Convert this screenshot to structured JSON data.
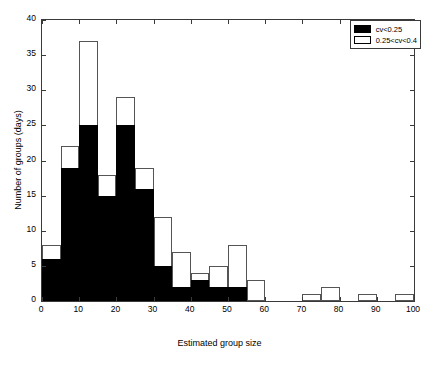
{
  "chart_data": {
    "type": "bar",
    "title": "",
    "subtitle": "",
    "xlabel": "Estimated group size",
    "ylabel": "Number of groups (days)",
    "xlim": [
      0,
      100
    ],
    "ylim": [
      0,
      40
    ],
    "xticks": [
      0,
      10,
      20,
      30,
      40,
      50,
      60,
      70,
      80,
      90,
      100
    ],
    "yticks": [
      0,
      5,
      10,
      15,
      20,
      25,
      30,
      35,
      40
    ],
    "grid": false,
    "bin_width": 5,
    "stacked": true,
    "legend_position": "top-right",
    "legend": [
      {
        "label": "cv<0.25",
        "style": "filled",
        "color": "#000000"
      },
      {
        "label": "0.25<cv<0.4",
        "style": "hollow",
        "color": "#ffffff"
      }
    ],
    "series": [
      {
        "name": "cv<0.25",
        "values": [
          6,
          19,
          25,
          15,
          25,
          16,
          5,
          2,
          3,
          2,
          2,
          0,
          0,
          0,
          0,
          0,
          0,
          0,
          0,
          0
        ]
      },
      {
        "name": "0.25<cv<0.4",
        "values": [
          2,
          3,
          12,
          3,
          4,
          3,
          7,
          5,
          1,
          3,
          6,
          3,
          0,
          0,
          1,
          2,
          0,
          1,
          0,
          1
        ]
      }
    ],
    "totals": [
      8,
      22,
      37,
      18,
      29,
      19,
      12,
      7,
      4,
      5,
      8,
      3,
      0,
      0,
      1,
      2,
      0,
      1,
      0,
      1
    ],
    "bins": [
      {
        "x0": 0,
        "x1": 5,
        "black": 6,
        "total": 8
      },
      {
        "x0": 5,
        "x1": 10,
        "black": 19,
        "total": 22
      },
      {
        "x0": 10,
        "x1": 15,
        "black": 25,
        "total": 37
      },
      {
        "x0": 15,
        "x1": 20,
        "black": 15,
        "total": 18
      },
      {
        "x0": 20,
        "x1": 25,
        "black": 25,
        "total": 29
      },
      {
        "x0": 25,
        "x1": 30,
        "black": 16,
        "total": 19
      },
      {
        "x0": 30,
        "x1": 35,
        "black": 5,
        "total": 12
      },
      {
        "x0": 35,
        "x1": 40,
        "black": 2,
        "total": 7
      },
      {
        "x0": 40,
        "x1": 45,
        "black": 3,
        "total": 4
      },
      {
        "x0": 45,
        "x1": 50,
        "black": 2,
        "total": 5
      },
      {
        "x0": 50,
        "x1": 55,
        "black": 2,
        "total": 8
      },
      {
        "x0": 55,
        "x1": 60,
        "black": 0,
        "total": 3
      },
      {
        "x0": 60,
        "x1": 65,
        "black": 0,
        "total": 0
      },
      {
        "x0": 65,
        "x1": 70,
        "black": 0,
        "total": 0
      },
      {
        "x0": 70,
        "x1": 75,
        "black": 0,
        "total": 1
      },
      {
        "x0": 75,
        "x1": 80,
        "black": 0,
        "total": 2
      },
      {
        "x0": 80,
        "x1": 85,
        "black": 0,
        "total": 0
      },
      {
        "x0": 85,
        "x1": 90,
        "black": 0,
        "total": 1
      },
      {
        "x0": 90,
        "x1": 95,
        "black": 0,
        "total": 0
      },
      {
        "x0": 95,
        "x1": 100,
        "black": 0,
        "total": 1
      }
    ]
  },
  "axes": {
    "x_tick_labels": [
      "0",
      "10",
      "20",
      "30",
      "40",
      "50",
      "60",
      "70",
      "80",
      "90",
      "100"
    ],
    "y_tick_labels": [
      "0",
      "5",
      "10",
      "15",
      "20",
      "25",
      "30",
      "35",
      "40"
    ],
    "x_title": "Estimated group size",
    "y_title": "Number of groups (days)"
  },
  "colors": {
    "axis": "#3a3a3a",
    "bar_edge": "#555555",
    "filled": "#000000",
    "hollow": "#ffffff",
    "background": "#ffffff"
  }
}
